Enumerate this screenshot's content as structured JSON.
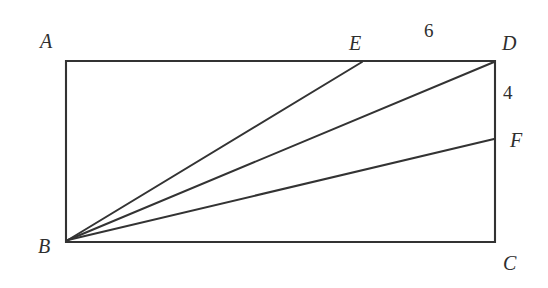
{
  "figure": {
    "type": "geometry-diagram",
    "background_color": "#ffffff",
    "stroke_color": "#333333",
    "label_color": "#2e2e2e",
    "width": 548,
    "height": 288
  },
  "shape": {
    "name": "rectangle-ABCD",
    "corners": {
      "A": {
        "x": 66,
        "y": 61
      },
      "D": {
        "x": 495,
        "y": 61
      },
      "C": {
        "x": 495,
        "y": 242
      },
      "B": {
        "x": 66,
        "y": 242
      }
    }
  },
  "points": {
    "E": {
      "x": 362,
      "y": 61,
      "on": "side-AD"
    },
    "F": {
      "x": 495,
      "y": 139,
      "on": "side-DC"
    }
  },
  "segments": [
    {
      "name": "segment-BE",
      "from": "B",
      "to": "E",
      "x1": 68,
      "y1": 240,
      "x2": 362,
      "y2": 62
    },
    {
      "name": "segment-BD",
      "from": "B",
      "to": "D",
      "x1": 68,
      "y1": 240,
      "x2": 494,
      "y2": 62
    },
    {
      "name": "segment-BF",
      "from": "B",
      "to": "F",
      "x1": 68,
      "y1": 240,
      "x2": 494,
      "y2": 139
    }
  ],
  "labels": {
    "A": "A",
    "B": "B",
    "C": "C",
    "D": "D",
    "E": "E",
    "F": "F"
  },
  "measurements": {
    "top_segment_ED": {
      "value": "6",
      "side": "top",
      "between": "E and D"
    },
    "right_segment_DF": {
      "value": "4",
      "side": "right",
      "between": "D and F"
    }
  }
}
